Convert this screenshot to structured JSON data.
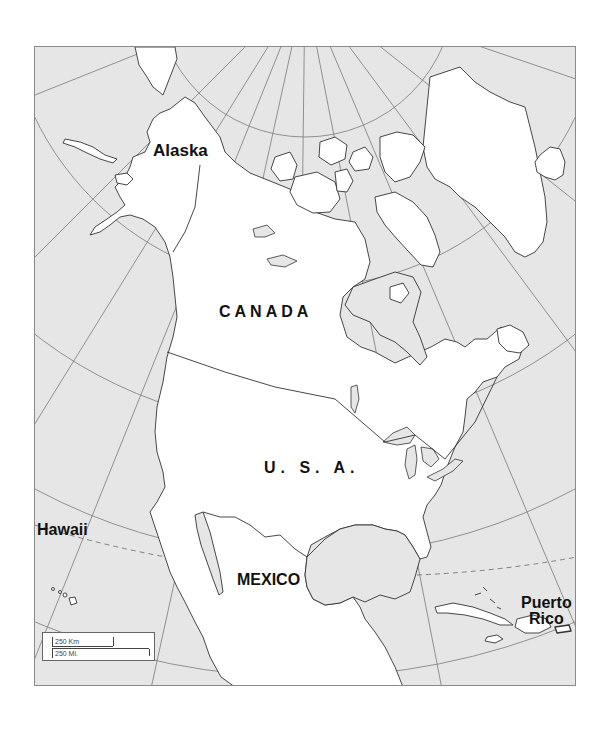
{
  "map": {
    "title": "North America outline map",
    "labels": {
      "alaska": "Alaska",
      "canada": "CANADA",
      "usa": "U. S. A.",
      "mexico": "MEXICO",
      "hawaii": "Hawaii",
      "puerto_rico_line1": "Puerto",
      "puerto_rico_line2": "Rico"
    },
    "scale": {
      "km": "250 Km",
      "mi": "250 Mi."
    },
    "colors": {
      "land": "#ffffff",
      "water": "#e6e6e6",
      "outline": "#333333",
      "graticule": "#7a7a7a"
    }
  }
}
